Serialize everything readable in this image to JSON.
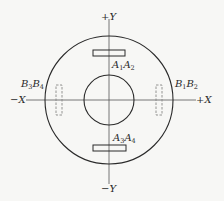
{
  "diagram": {
    "type": "sensor-coil-layout",
    "colors": {
      "line": "#2a2a2a",
      "axis": "#555555",
      "dashed": "#888888",
      "background": "#f7f7f5"
    },
    "center": {
      "x": 109,
      "y": 100
    },
    "outer_circle": {
      "r": 64
    },
    "inner_circle": {
      "r": 25
    },
    "axes": {
      "pos_y": {
        "sign": "+",
        "name": "Y"
      },
      "neg_y": {
        "sign": "−",
        "name": "Y"
      },
      "pos_x": {
        "sign": "+",
        "name": "X"
      },
      "neg_x": {
        "sign": "−",
        "name": "X"
      }
    },
    "elements": [
      {
        "id": "A1A2",
        "label": "A",
        "sub1": "1",
        "mid": "A",
        "sub2": "2",
        "style": "solid",
        "position": "top"
      },
      {
        "id": "A3A4",
        "label": "A",
        "sub1": "3",
        "mid": "A",
        "sub2": "4",
        "style": "solid",
        "position": "bottom"
      },
      {
        "id": "B1B2",
        "label": "B",
        "sub1": "1",
        "mid": "B",
        "sub2": "2",
        "style": "dashed",
        "position": "right"
      },
      {
        "id": "B3B4",
        "label": "B",
        "sub1": "3",
        "mid": "B",
        "sub2": "4",
        "style": "dashed",
        "position": "left"
      }
    ]
  }
}
